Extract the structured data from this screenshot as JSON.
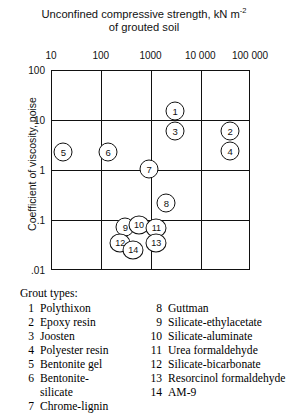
{
  "chart_data": {
    "type": "scatter",
    "title_line1_pre": "Unconfined compressive strength, kN m",
    "title_line1_sup": "-2",
    "title_line2": "of grouted soil",
    "xlabel": "Unconfined compressive strength, kN m⁻²of grouted soil",
    "ylabel": "Coefficient of viscosity, poise",
    "xscale": "log",
    "yscale": "log",
    "xlim": [
      10,
      100000
    ],
    "ylim": [
      0.01,
      100
    ],
    "xticks": [
      "10",
      "100",
      "1000",
      "10 000",
      "100 000"
    ],
    "xtick_values": [
      10,
      100,
      1000,
      10000,
      100000
    ],
    "yticks": [
      "100",
      "10",
      "1",
      ".1",
      ".01"
    ],
    "ytick_values": [
      100,
      10,
      1,
      0.1,
      0.01
    ],
    "grid": true,
    "legend_position": "below-plot",
    "points": [
      {
        "id": "1",
        "label": "Polythixon",
        "x": 3000,
        "y": 16
      },
      {
        "id": "2",
        "label": "Epoxy resin",
        "x": 38000,
        "y": 6.3
      },
      {
        "id": "3",
        "label": "Joosten",
        "x": 3000,
        "y": 6.3
      },
      {
        "id": "4",
        "label": "Polyester resin",
        "x": 38000,
        "y": 2.5
      },
      {
        "id": "5",
        "label": "Bentonite gel",
        "x": 17,
        "y": 2.4
      },
      {
        "id": "6",
        "label": "Bentonite-silicate",
        "x": 135,
        "y": 2.4
      },
      {
        "id": "7",
        "label": "Chrome-lignin",
        "x": 900,
        "y": 1.1
      },
      {
        "id": "8",
        "label": "Guttman",
        "x": 2000,
        "y": 0.23
      },
      {
        "id": "9",
        "label": "Silicate-ethylacetate",
        "x": 300,
        "y": 0.075
      },
      {
        "id": "10",
        "label": "Silicate-aluminate",
        "x": 560,
        "y": 0.082
      },
      {
        "id": "11",
        "label": "Urea formaldehyde",
        "x": 1250,
        "y": 0.073
      },
      {
        "id": "12",
        "label": "Silicate-bicarbonate",
        "x": 235,
        "y": 0.036
      },
      {
        "id": "13",
        "label": "Resorcinol formaldehyde",
        "x": 1250,
        "y": 0.036
      },
      {
        "id": "14",
        "label": "AM-9",
        "x": 430,
        "y": 0.026
      }
    ]
  },
  "chart": {
    "title_pre": "Unconfined compressive strength, kN m",
    "title_sup": "-2",
    "title_line2": "of grouted soil",
    "y_axis_title": "Coefficient of viscosity,  poise",
    "x_ticks": [
      {
        "label": "10"
      },
      {
        "label": "100"
      },
      {
        "label": "1000"
      },
      {
        "label": "10 000"
      },
      {
        "label": "100 000"
      }
    ],
    "y_ticks": [
      {
        "label": "100"
      },
      {
        "label": "10"
      },
      {
        "label": "1"
      },
      {
        "label": ".1"
      },
      {
        "label": ".01"
      }
    ],
    "points": [
      {
        "id": "1"
      },
      {
        "id": "2"
      },
      {
        "id": "3"
      },
      {
        "id": "4"
      },
      {
        "id": "5"
      },
      {
        "id": "6"
      },
      {
        "id": "7"
      },
      {
        "id": "8"
      },
      {
        "id": "9"
      },
      {
        "id": "10"
      },
      {
        "id": "11"
      },
      {
        "id": "12"
      },
      {
        "id": "13"
      },
      {
        "id": "14"
      }
    ]
  },
  "legend": {
    "heading": "Grout types:",
    "left": [
      {
        "num": "1",
        "name": "Polythixon"
      },
      {
        "num": "2",
        "name": "Epoxy resin"
      },
      {
        "num": "3",
        "name": "Joosten"
      },
      {
        "num": "4",
        "name": "Polyester resin"
      },
      {
        "num": "5",
        "name": "Bentonite gel"
      },
      {
        "num": "6",
        "name": "Bentonite-"
      },
      {
        "num": "",
        "name": "silicate"
      },
      {
        "num": "7",
        "name": "Chrome-lignin"
      }
    ],
    "right": [
      {
        "num": "8",
        "name": "Guttman"
      },
      {
        "num": "9",
        "name": "Silicate-ethylacetate"
      },
      {
        "num": "10",
        "name": "Silicate-aluminate"
      },
      {
        "num": "11",
        "name": "Urea formaldehyde"
      },
      {
        "num": "12",
        "name": "Silicate-bicarbonate"
      },
      {
        "num": "13",
        "name": "Resorcinol formaldehyde"
      },
      {
        "num": "14",
        "name": "AM-9"
      }
    ]
  }
}
